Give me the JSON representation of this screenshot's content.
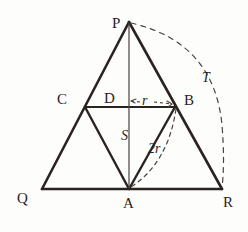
{
  "figure": {
    "stroke_color": "#2a2320",
    "thin_stroke_color": "#3a312c",
    "background_color": "#fdfdfc"
  },
  "vertices": [
    {
      "id": "P",
      "label": "P",
      "x": 129,
      "y": 22,
      "label_x": 112,
      "label_y": 16
    },
    {
      "id": "Q",
      "label": "Q",
      "x": 42,
      "y": 189,
      "label_x": 17,
      "label_y": 191
    },
    {
      "id": "R",
      "label": "R",
      "x": 222,
      "y": 189,
      "label_x": 223,
      "label_y": 195
    },
    {
      "id": "A",
      "label": "A",
      "x": 129,
      "y": 189,
      "label_x": 123,
      "label_y": 196
    },
    {
      "id": "B",
      "label": "B",
      "x": 175,
      "y": 107,
      "label_x": 184,
      "label_y": 93
    },
    {
      "id": "C",
      "label": "C",
      "x": 85,
      "y": 107,
      "label_x": 57,
      "label_y": 92
    },
    {
      "id": "D",
      "label": "D",
      "x": 129,
      "y": 107,
      "label_x": 104,
      "label_y": 91
    }
  ],
  "measures": [
    {
      "id": "r",
      "label": "r",
      "x": 142,
      "y": 94,
      "style": "italic"
    },
    {
      "id": "2r",
      "label": "2r",
      "x": 148,
      "y": 142,
      "style": "italic"
    },
    {
      "id": "S",
      "label": "S",
      "x": 121,
      "y": 129,
      "style": "italic"
    },
    {
      "id": "T",
      "label": "T",
      "x": 202,
      "y": 71,
      "style": "italic"
    }
  ],
  "segments": [
    {
      "id": "PQ",
      "from": "P",
      "to": "Q",
      "weight": "thick"
    },
    {
      "id": "PR",
      "from": "P",
      "to": "R",
      "weight": "thick"
    },
    {
      "id": "QR",
      "from": "Q",
      "to": "R",
      "weight": "thick"
    },
    {
      "id": "CB",
      "from": "C",
      "to": "B",
      "weight": "thin"
    },
    {
      "id": "CA",
      "from": "C",
      "to": "A",
      "weight": "thick"
    },
    {
      "id": "AB",
      "from": "A",
      "to": "B",
      "weight": "thick"
    },
    {
      "id": "PA",
      "from": "P",
      "to": "A",
      "weight": "hairline"
    }
  ],
  "arcs": [
    {
      "id": "arc-2r",
      "from": "B",
      "to": "A",
      "radius": 93,
      "dashed": true,
      "note": "arc of radius 2r centred at C through B and A"
    },
    {
      "id": "arc-T",
      "from": "P",
      "to": "R",
      "radius": 168,
      "dashed": true,
      "note": "arc of radius AP centred at A from P to R"
    }
  ],
  "arrows": [
    {
      "id": "r-arrow",
      "from_x": 130,
      "from_y": 101,
      "to_x": 174,
      "to_y": 104,
      "dashed": true,
      "note": "radius marker from D to B labelled r"
    }
  ]
}
